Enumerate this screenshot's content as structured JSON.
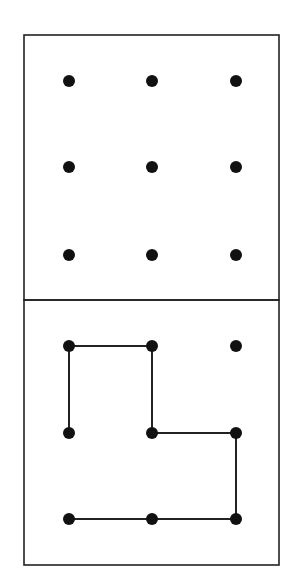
{
  "diagram": {
    "colors": {
      "background": "#ffffff",
      "stroke": "#222222",
      "dot": "#111111"
    },
    "grid": {
      "columns": 3,
      "rows": 3,
      "col_x": [
        69,
        152,
        236
      ],
      "top_panel_row_y": [
        81,
        167,
        255
      ],
      "bottom_panel_row_y": [
        346,
        433,
        519
      ],
      "dot_radius": 6
    },
    "panels": [
      {
        "name": "top-panel",
        "x": 24,
        "y": 35,
        "width": 255,
        "height": 265,
        "connections": []
      },
      {
        "name": "bottom-panel",
        "x": 24,
        "y": 300,
        "width": 255,
        "height": 265,
        "connections": [
          {
            "from": [
              0,
              0
            ],
            "to": [
              1,
              0
            ]
          },
          {
            "from": [
              0,
              0
            ],
            "to": [
              0,
              1
            ]
          },
          {
            "from": [
              1,
              0
            ],
            "to": [
              1,
              1
            ]
          },
          {
            "from": [
              1,
              1
            ],
            "to": [
              2,
              1
            ]
          },
          {
            "from": [
              2,
              1
            ],
            "to": [
              2,
              2
            ]
          },
          {
            "from": [
              2,
              2
            ],
            "to": [
              1,
              2
            ]
          },
          {
            "from": [
              1,
              2
            ],
            "to": [
              0,
              2
            ]
          }
        ]
      }
    ]
  }
}
